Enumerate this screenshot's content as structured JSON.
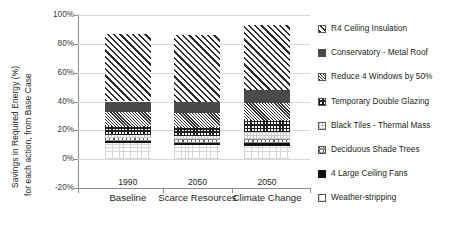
{
  "chart_data": {
    "type": "bar",
    "stacked": true,
    "title": "",
    "xlabel": "",
    "ylabel": "Savings in Required Energy (%) for each action, from Base Case",
    "ylabel_line1": "Savings in Required Energy (%)",
    "ylabel_line2": "for each action, from Base Case",
    "ylim": [
      -20,
      100
    ],
    "ytick_labels": [
      "100%",
      "80%",
      "60%",
      "40%",
      "20%",
      "0%",
      "-20%"
    ],
    "ytick_values": [
      100,
      80,
      60,
      40,
      20,
      0,
      -20
    ],
    "grid": true,
    "legend_position": "right",
    "categories": [
      "Baseline",
      "Scarce Resources",
      "Climate Change"
    ],
    "category_years": [
      "1990",
      "2050",
      "2050"
    ],
    "series": [
      {
        "name": "R4 Ceiling Insulation",
        "pattern": "diagonal-hatch-wide",
        "values": [
          47.0,
          46.5,
          45.0
        ]
      },
      {
        "name": "Conservatory - Metal Roof",
        "pattern": "solid-dark-gray",
        "values": [
          7.0,
          7.5,
          9.0
        ]
      },
      {
        "name": "Reduce 4 Windows by 50%",
        "pattern": "diagonal-hatch-fine",
        "values": [
          10.0,
          10.0,
          12.0
        ]
      },
      {
        "name": "Temporary Double Glazing",
        "pattern": "cross-grid",
        "values": [
          6.0,
          6.0,
          8.0
        ]
      },
      {
        "name": "Black Tiles - Thermal Mass",
        "pattern": "light-dots",
        "values": [
          2.5,
          2.0,
          5.0
        ]
      },
      {
        "name": "Deciduous Shade Trees",
        "pattern": "brick-dash",
        "values": [
          2.0,
          3.0,
          3.0
        ]
      },
      {
        "name": "4 Large Ceiling Fans",
        "pattern": "solid-black",
        "values": [
          1.0,
          1.5,
          2.0
        ]
      },
      {
        "name": "Weather-stripping",
        "pattern": "faint-speckle",
        "values": [
          11.5,
          9.5,
          9.0
        ]
      }
    ],
    "totals": [
      87.0,
      86.0,
      93.0
    ],
    "colors": {
      "grid": "#d9d9d9",
      "axis": "#8c8c8c",
      "text": "#231f20",
      "dark_gray": "#4a4a4a",
      "black": "#111111"
    }
  },
  "legend": {
    "items": [
      {
        "label": "R4 Ceiling Insulation",
        "icon": "swatch-diagonal-hatch-wide-icon"
      },
      {
        "label": "Conservatory - Metal Roof",
        "icon": "swatch-solid-dark-icon"
      },
      {
        "label": "Reduce 4 Windows by 50%",
        "icon": "swatch-diagonal-hatch-fine-icon"
      },
      {
        "label": "Temporary Double Glazing",
        "icon": "swatch-cross-grid-icon"
      },
      {
        "label": "Black Tiles - Thermal Mass",
        "icon": "swatch-light-dots-icon"
      },
      {
        "label": "Deciduous Shade Trees",
        "icon": "swatch-brick-dash-icon"
      },
      {
        "label": "4 Large Ceiling Fans",
        "icon": "swatch-solid-black-icon"
      },
      {
        "label": "Weather-stripping",
        "icon": "swatch-faint-speckle-icon"
      }
    ]
  }
}
